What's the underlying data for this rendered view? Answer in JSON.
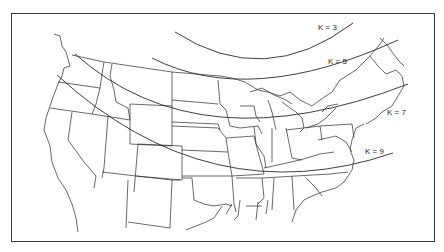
{
  "figure": {
    "type": "contour-map",
    "region": "contiguous United States",
    "frame_color": "#3a3a3a",
    "line_color": "#2a2a2a"
  },
  "contours": [
    {
      "label": "K = 3",
      "label_x": 318,
      "label_y": 30,
      "path": "M175,32 Q265,90 353,23"
    },
    {
      "label": "K = 5",
      "label_x": 328,
      "label_y": 64,
      "path": "M152,58 Q250,108 398,40"
    },
    {
      "label": "K = 7",
      "label_x": 387,
      "label_y": 115,
      "path": "M75,54 Q200,165 408,84"
    },
    {
      "label": "K = 9",
      "label_x": 365,
      "label_y": 154,
      "path": "M57,75 Q210,215 393,153"
    }
  ],
  "caption": {
    "text": "",
    "note": "caption text cut off at bottom edge"
  }
}
